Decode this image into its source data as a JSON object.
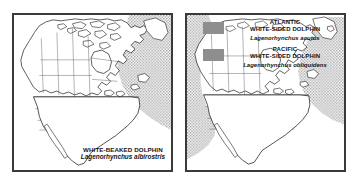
{
  "figure": {
    "panels": [
      {
        "id": "white-beaked-dolphin-map",
        "caption": {
          "common_name": "WHITE-BEAKED DOLPHIN",
          "scientific_name": "Lagenorhynchus albirostris"
        },
        "map_region": "North America",
        "range_shading_color": "#a8a8a8",
        "range_areas": [
          "North Atlantic Ocean"
        ]
      },
      {
        "id": "white-sided-dolphins-map",
        "legend": [
          {
            "swatch_color": "#8e8e8e",
            "region": "ATLANTIC",
            "common_name": "WHITE-SIDED DOLPHIN",
            "scientific_name": "Lagenorhynchus acutus"
          },
          {
            "swatch_color": "#8e8e8e",
            "region": "PACIFIC",
            "common_name": "WHITE-SIDED DOLPHIN",
            "scientific_name": "Lagenorhynchus obliquidens"
          }
        ],
        "map_region": "North America",
        "range_shading_color": "#a8a8a8",
        "range_areas": [
          "North Atlantic Ocean",
          "North Pacific Ocean"
        ]
      }
    ],
    "frame_color": "#3a3a3a",
    "background_color": "#ffffff",
    "coastline_color": "#1a1a1a",
    "border_line_color": "#4a4a4a"
  }
}
